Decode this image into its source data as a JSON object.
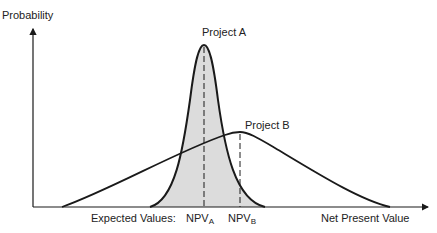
{
  "labels": {
    "y_axis": "Probability",
    "x_axis": "Net Present Value",
    "project_a": "Project A",
    "project_b": "Project B",
    "expected_values": "Expected Values:",
    "npv_a_main": "NPV",
    "npv_a_sub": "A",
    "npv_b_main": "NPV",
    "npv_b_sub": "B"
  },
  "colors": {
    "line": "#1a1a1a",
    "fill_a": "#dcdcdc",
    "background": "#ffffff"
  }
}
